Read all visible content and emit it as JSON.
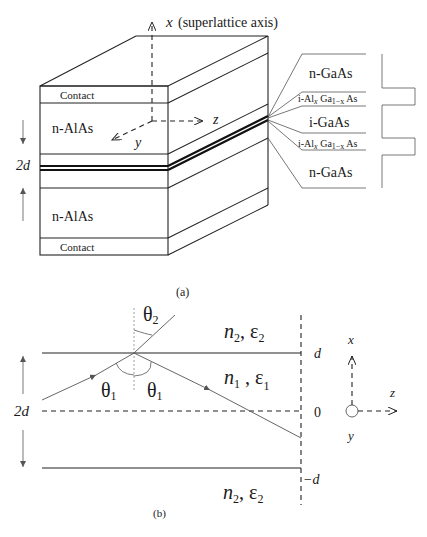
{
  "panel_a": {
    "caption": "(a)",
    "axis_x_label": "x",
    "axis_x_note": "(superlattice axis)",
    "axis_z_label": "z",
    "axis_y_label": "y",
    "front_labels": {
      "contact_top": "Contact",
      "alas_top": "n-AlAs",
      "alas_bottom": "n-AlAs",
      "contact_bottom": "Contact"
    },
    "period_label": "2d",
    "layer_labels": [
      {
        "main": "n-GaAs"
      },
      {
        "prefix": "i-Al",
        "sub1": "x",
        "mid": " Ga",
        "sub2": "1−x",
        "suffix": " As"
      },
      {
        "main": "i-GaAs"
      },
      {
        "prefix": "i-Al",
        "sub1": "x",
        "mid": " Ga",
        "sub2": "1−x",
        "suffix": " As"
      },
      {
        "main": "n-GaAs"
      }
    ]
  },
  "panel_b": {
    "caption": "(b)",
    "theta2": "θ",
    "theta2_sub": "2",
    "theta1": "θ",
    "theta1_sub": "1",
    "region_top": {
      "n": "n",
      "n_sub": "2",
      "eps": "ε",
      "eps_sub": "2"
    },
    "region_mid": {
      "n": "n",
      "n_sub": "1",
      "eps": "ε",
      "eps_sub": "1"
    },
    "region_bot": {
      "n": "n",
      "n_sub": "2",
      "eps": "ε",
      "eps_sub": "2"
    },
    "width_label": "2d",
    "tick_top": "d",
    "tick_mid": "0",
    "tick_bot": "−d",
    "axis_x": "x",
    "axis_z": "z",
    "axis_y": "y"
  }
}
